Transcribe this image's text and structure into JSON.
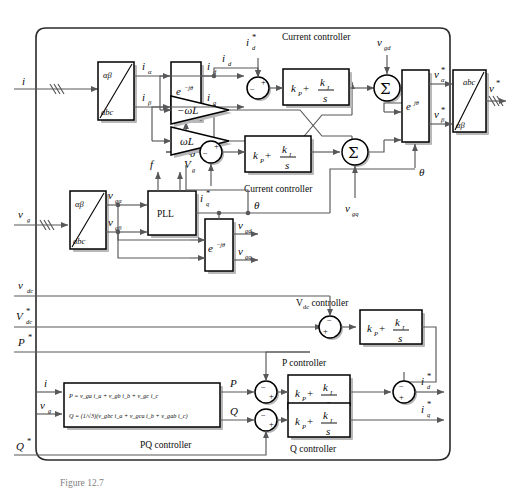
{
  "figure": {
    "domain": "control-block-diagram",
    "title_caption": "Figure 12.7",
    "outer_border": true,
    "accent": "#58585a",
    "line_color": "#000000",
    "background": "#ffffff"
  },
  "inputs": {
    "current": "i",
    "grid_voltage": "v",
    "grid_voltage_sub": "g",
    "dc_voltage": "v",
    "dc_voltage_sub": "dc",
    "dc_voltage_ref": "V",
    "dc_voltage_ref_sub": "dc",
    "dc_voltage_ref_star": "*",
    "p_ref": "P",
    "p_ref_star": "*",
    "q_ref": "Q",
    "q_ref_star": "*"
  },
  "outputs": {
    "v_star": "v",
    "v_star_sup": "*"
  },
  "transform_blocks": [
    {
      "name": "current-abc-to-alphabeta",
      "top": "αβ",
      "bottom": "abc"
    },
    {
      "name": "voltage-abc-to-alphabeta",
      "top": "αβ",
      "bottom": "abc"
    },
    {
      "name": "output-alphabeta-to-abc",
      "top": "abc",
      "bottom": "αβ"
    }
  ],
  "rotation_blocks": [
    {
      "name": "current-park",
      "label": "e",
      "exp": "−jθ"
    },
    {
      "name": "grid-voltage-park",
      "label": "e",
      "exp": "−jθ"
    },
    {
      "name": "inverse-park",
      "label": "e",
      "exp": "jθ"
    }
  ],
  "pll": {
    "label": "PLL",
    "out_f": "f",
    "out_vg": "V",
    "out_vg_sub": "g",
    "out_theta": "θ"
  },
  "signals": {
    "i_alpha": "i",
    "i_alpha_sub": "α",
    "i_beta": "i",
    "i_beta_sub": "β",
    "i_d": "i",
    "i_d_sub": "d",
    "i_q": "i",
    "i_q_sub": "q",
    "i_d_ref": "i",
    "i_d_ref_sub": "d",
    "i_d_ref_star": "*",
    "i_q_ref": "i",
    "i_q_ref_sub": "q",
    "i_q_ref_star": "*",
    "v_galpha": "v",
    "v_galpha_sub": "gα",
    "v_gbeta": "v",
    "v_gbeta_sub": "gβ",
    "v_gd": "v",
    "v_gd_sub": "gd",
    "v_gq": "v",
    "v_gq_sub": "gq",
    "v_alpha_star": "v",
    "v_alpha_star_sub": "α",
    "v_beta_star": "v",
    "v_beta_star_sub": "β",
    "theta": "θ",
    "P": "P",
    "Q": "Q"
  },
  "gain_blocks": [
    {
      "name": "negative-omega-l",
      "label": "−ωL"
    },
    {
      "name": "positive-omega-l",
      "label": "ωL"
    }
  ],
  "pi_controllers": [
    {
      "name": "current-controller-d",
      "title": "Current controller",
      "kp": "k",
      "kp_sub": "P",
      "ki": "k",
      "ki_sub": "I",
      "den": "s"
    },
    {
      "name": "current-controller-q",
      "title": "Current controller",
      "kp": "k",
      "kp_sub": "P",
      "ki": "k",
      "ki_sub": "I",
      "den": "s"
    },
    {
      "name": "vdc-controller",
      "title": "V",
      "title_sub": "dc",
      "title_rest": " controller",
      "kp": "k",
      "kp_sub": "P",
      "ki": "k",
      "ki_sub": "I",
      "den": "s"
    },
    {
      "name": "p-controller",
      "title": "P controller",
      "kp": "k",
      "kp_sub": "P",
      "ki": "k",
      "ki_sub": "I",
      "den": "s"
    },
    {
      "name": "q-controller",
      "title": "Q controller",
      "kp": "k",
      "kp_sub": "P",
      "ki": "k",
      "ki_sub": "I",
      "den": "s"
    }
  ],
  "pq_block": {
    "name": "pq-controller",
    "title": "PQ controller",
    "p_equation": "P = v i  + v i  + v i",
    "p_eq_plain": "P = v_ga i_a + v_gb i_b + v_gc i_c",
    "q_eq_plain": "Q = (1/√3)(v_gbc i_a + v_gca i_b + v_gab i_c)",
    "q_lead": "Q =",
    "q_frac_num": "1",
    "q_frac_den": "√3"
  },
  "summing_junctions": [
    {
      "name": "sum-id-error",
      "signs": [
        "−",
        "+"
      ]
    },
    {
      "name": "sum-iq-error",
      "signs": [
        "−",
        "+"
      ]
    },
    {
      "name": "sum-vd-out",
      "glyph": "Σ"
    },
    {
      "name": "sum-vq-out",
      "glyph": "Σ"
    },
    {
      "name": "sum-vdc-error",
      "signs": [
        "−",
        "+"
      ]
    },
    {
      "name": "sum-p-error",
      "signs": [
        "−",
        "+"
      ]
    },
    {
      "name": "sum-q-error",
      "signs": [
        "−",
        "+"
      ]
    },
    {
      "name": "sum-id-ref",
      "signs": [
        "−",
        "+"
      ]
    }
  ]
}
